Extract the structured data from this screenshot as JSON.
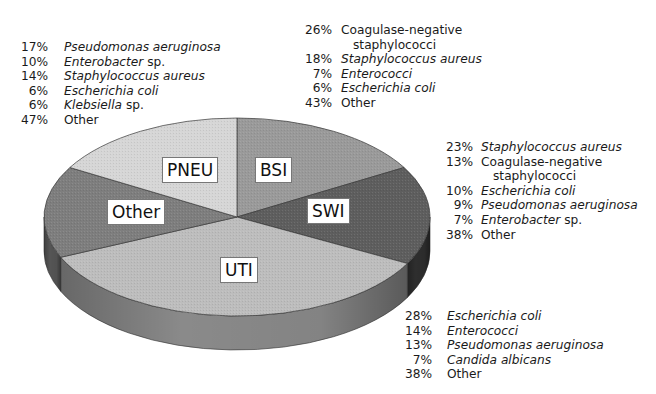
{
  "chart_data": {
    "type": "pie",
    "style": "3d-exploded-none",
    "title": "",
    "slices": [
      {
        "label": "BSI",
        "fill": "#9a9a9a",
        "side": "#707070",
        "pathogens": [
          {
            "pct": "26%",
            "name": "Coagulase-negative",
            "name2": "staphylococci",
            "italic": false
          },
          {
            "pct": "18%",
            "name": "Staphylococcus aureus",
            "italic": true
          },
          {
            "pct": "7%",
            "name": "Enterococci",
            "italic": true
          },
          {
            "pct": "6%",
            "name": "Escherichia coli",
            "italic": true
          },
          {
            "pct": "43%",
            "name": "Other",
            "italic": false
          }
        ]
      },
      {
        "label": "SWI",
        "fill": "#5e5e5e",
        "side": "#2e2e2e",
        "pathogens": [
          {
            "pct": "23%",
            "name": "Staphylococcus aureus",
            "italic": true
          },
          {
            "pct": "13%",
            "name": "Coagulase-negative",
            "name2": "staphylococci",
            "italic": false
          },
          {
            "pct": "10%",
            "name": "Escherichia coli",
            "italic": true
          },
          {
            "pct": "9%",
            "name": "Pseudomonas aeruginosa",
            "italic": true
          },
          {
            "pct": "7%",
            "name": "Enterobacter",
            "suffix": " sp.",
            "italic": true
          },
          {
            "pct": "38%",
            "name": "Other",
            "italic": false
          }
        ]
      },
      {
        "label": "UTI",
        "fill": "#bdbdbd",
        "side": "#8a8a8a",
        "pathogens": [
          {
            "pct": "28%",
            "name": "Escherichia coli",
            "italic": true
          },
          {
            "pct": "14%",
            "name": "Enterococci",
            "italic": true
          },
          {
            "pct": "13%",
            "name": "Pseudomonas aeruginosa",
            "italic": true
          },
          {
            "pct": "7%",
            "name": "Candida albicans",
            "italic": true
          },
          {
            "pct": "38%",
            "name": "Other",
            "italic": false
          }
        ]
      },
      {
        "label": "Other",
        "fill": "#7e7e7e",
        "side": "#555555",
        "pathogens": []
      },
      {
        "label": "PNEU",
        "fill": "#d6d6d6",
        "side": "#a8a8a8",
        "pathogens": [
          {
            "pct": "17%",
            "name": "Pseudomonas aeruginosa",
            "italic": true
          },
          {
            "pct": "10%",
            "name": "Enterobacter",
            "suffix": " sp.",
            "italic": true
          },
          {
            "pct": "14%",
            "name": "Staphylococcus aureus",
            "italic": true
          },
          {
            "pct": "6%",
            "name": "Escherichia coli",
            "italic": true
          },
          {
            "pct": "6%",
            "name": "Klebsiella",
            "suffix": " sp.",
            "italic": true
          },
          {
            "pct": "47%",
            "name": "Other",
            "italic": false
          }
        ]
      }
    ],
    "slice_angles_deg_clockwise_from_top": {
      "BSI": [
        0,
        60
      ],
      "SWI": [
        60,
        118
      ],
      "UTI": [
        118,
        246
      ],
      "Other": [
        246,
        300
      ],
      "PNEU": [
        300,
        360
      ]
    },
    "legend_position": "annotations around pie"
  }
}
